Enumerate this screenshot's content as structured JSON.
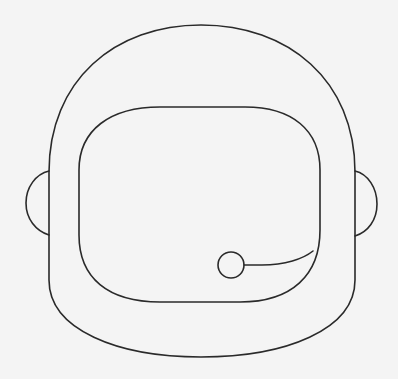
{
  "illustration": {
    "subject": "astronaut-helmet",
    "style": "line-art",
    "colors": {
      "background": "#f4f4f4",
      "stroke": "#2a2a2a"
    },
    "parts": [
      {
        "name": "helmet-shell"
      },
      {
        "name": "left-ear-piece"
      },
      {
        "name": "right-ear-piece"
      },
      {
        "name": "visor"
      },
      {
        "name": "microphone"
      }
    ]
  }
}
